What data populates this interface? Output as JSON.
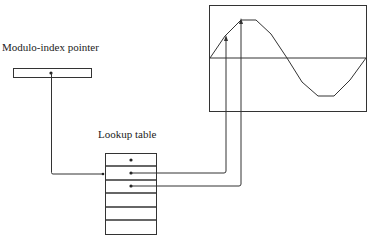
{
  "labels": {
    "pointer": "Modulo-index pointer",
    "table": "Lookup table"
  },
  "lookup_table": {
    "rows": 6,
    "marked_rows": [
      0,
      1,
      2
    ]
  },
  "waveform": {
    "type": "sine",
    "cycles": 1
  }
}
